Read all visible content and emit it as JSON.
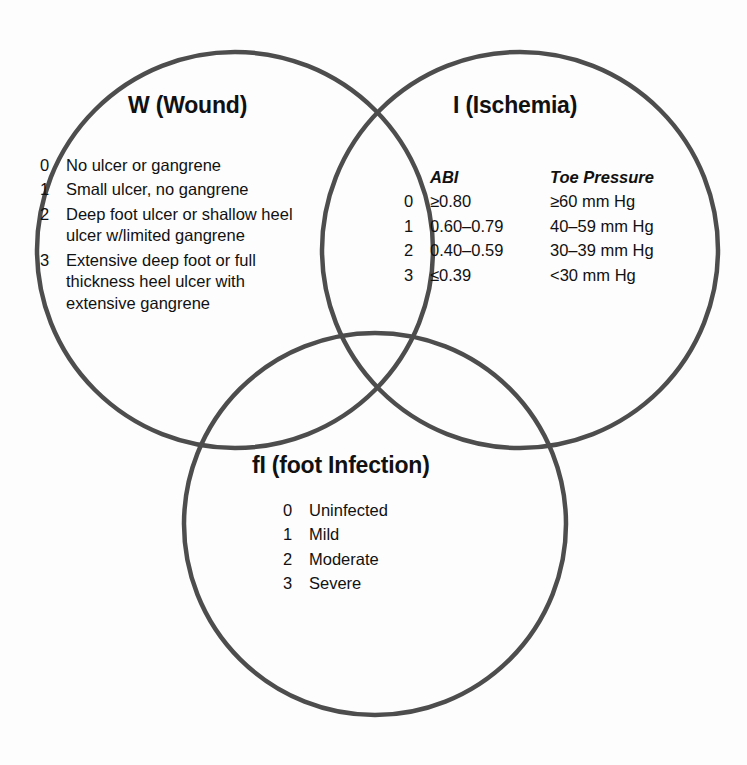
{
  "figure": {
    "type": "venn-diagram",
    "circle_count": 3,
    "stroke_color": "#4d4d4d",
    "background_color": "#ffffff"
  },
  "circles": {
    "wound": {
      "label": "W (Wound)",
      "cx": 235,
      "cy": 250,
      "r": 198
    },
    "ischemia": {
      "label": "I (Ischemia)",
      "cx": 520,
      "cy": 250,
      "r": 198
    },
    "infection": {
      "label": "fI (foot Infection)",
      "cx": 375,
      "cy": 524,
      "r": 191
    }
  },
  "wound": {
    "title": "W (Wound)",
    "grades": [
      {
        "grade": "0",
        "description": "No ulcer or gangrene"
      },
      {
        "grade": "1",
        "description": "Small ulcer, no gangrene"
      },
      {
        "grade": "2",
        "description": "Deep foot ulcer or shallow heel ulcer w/limited gangrene"
      },
      {
        "grade": "3",
        "description": "Extensive deep foot or full thickness heel ulcer with extensive gangrene"
      }
    ]
  },
  "ischemia": {
    "title": "I (Ischemia)",
    "headers": {
      "grade": "",
      "abi": "ABI",
      "toe_pressure": "Toe Pressure"
    },
    "grades": [
      {
        "grade": "0",
        "abi": "≥0.80",
        "toe_pressure": "≥60 mm Hg"
      },
      {
        "grade": "1",
        "abi": "0.60–0.79",
        "toe_pressure": "40–59 mm Hg"
      },
      {
        "grade": "2",
        "abi": "0.40–0.59",
        "toe_pressure": "30–39 mm Hg"
      },
      {
        "grade": "3",
        "abi": "≤0.39",
        "toe_pressure": "<30 mm Hg"
      }
    ]
  },
  "infection": {
    "title": "fI (foot Infection)",
    "grades": [
      {
        "grade": "0",
        "description": "Uninfected"
      },
      {
        "grade": "1",
        "description": "Mild"
      },
      {
        "grade": "2",
        "description": "Moderate"
      },
      {
        "grade": "3",
        "description": "Severe"
      }
    ]
  }
}
